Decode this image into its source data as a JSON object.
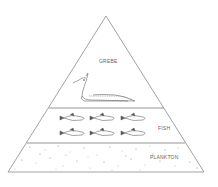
{
  "diagram": {
    "type": "ecological-pyramid",
    "levels": [
      {
        "name": "grebe",
        "label": "GREBE",
        "count": 1
      },
      {
        "name": "fish",
        "label": "FISH",
        "count": 6
      },
      {
        "name": "plankton",
        "label": "PLANKTON",
        "count": null
      }
    ],
    "colors": {
      "line": "#8a8a8a",
      "fill": "#ffffff",
      "ink": "#555555"
    }
  }
}
